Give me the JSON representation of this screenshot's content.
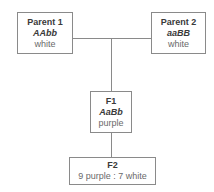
{
  "diagram": {
    "parent1": {
      "label": "Parent 1",
      "genotype": "AAbb",
      "phenotype": "white"
    },
    "parent2": {
      "label": "Parent 2",
      "genotype": "aaBB",
      "phenotype": "white"
    },
    "f1": {
      "label": "F1",
      "genotype": "AaBb",
      "phenotype": "purple"
    },
    "f2": {
      "label": "F2",
      "ratio": "9 purple : 7 white"
    }
  }
}
